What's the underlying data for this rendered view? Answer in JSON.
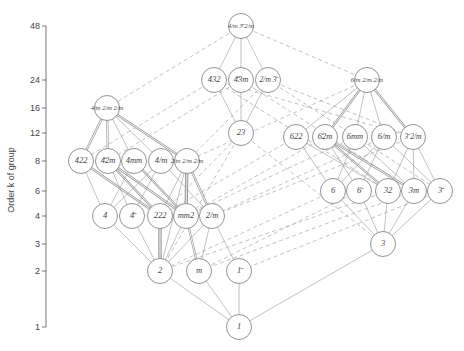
{
  "chart_data": {
    "type": "diagram",
    "title": "",
    "ylabel": "Order k of group",
    "y_ticks": [
      1,
      2,
      3,
      4,
      6,
      8,
      12,
      16,
      24,
      48
    ],
    "nodes": [
      {
        "id": "m3m",
        "label": "4/m 3̄ 2/m",
        "order": 48,
        "x": 241,
        "y": 26
      },
      {
        "id": "432",
        "label": "432",
        "order": 24,
        "x": 214,
        "y": 80
      },
      {
        "id": "-43m",
        "label": "4̄3m",
        "order": 24,
        "x": 241,
        "y": 80
      },
      {
        "id": "m-3",
        "label": "2/m 3̄",
        "order": 24,
        "x": 268,
        "y": 80
      },
      {
        "id": "6/mmm",
        "label": "6/m 2/m 2/m",
        "order": 24,
        "x": 367,
        "y": 80
      },
      {
        "id": "4/mmm",
        "label": "4/m 2/m 2/m",
        "order": 16,
        "x": 107,
        "y": 108
      },
      {
        "id": "23",
        "label": "23",
        "order": 12,
        "x": 241,
        "y": 133
      },
      {
        "id": "622",
        "label": "622",
        "order": 12,
        "x": 296,
        "y": 137
      },
      {
        "id": "-6m2",
        "label": "6̄2m",
        "order": 12,
        "x": 325,
        "y": 137
      },
      {
        "id": "6mm",
        "label": "6mm",
        "order": 12,
        "x": 355,
        "y": 137
      },
      {
        "id": "6/m",
        "label": "6/m",
        "order": 12,
        "x": 384,
        "y": 137
      },
      {
        "id": "-3m",
        "label": "3̄ 2/m",
        "order": 12,
        "x": 413,
        "y": 137
      },
      {
        "id": "422",
        "label": "422",
        "order": 8,
        "x": 81,
        "y": 161
      },
      {
        "id": "-42m",
        "label": "4̄2m",
        "order": 8,
        "x": 108,
        "y": 161
      },
      {
        "id": "4mm",
        "label": "4mm",
        "order": 8,
        "x": 134,
        "y": 161
      },
      {
        "id": "4/m",
        "label": "4/m",
        "order": 8,
        "x": 161,
        "y": 161
      },
      {
        "id": "mmm",
        "label": "2/m 2/m 2/m",
        "order": 8,
        "x": 187,
        "y": 161
      },
      {
        "id": "6",
        "label": "6",
        "order": 6,
        "x": 333,
        "y": 191
      },
      {
        "id": "-6",
        "label": "6̄",
        "order": 6,
        "x": 359,
        "y": 191
      },
      {
        "id": "32",
        "label": "32",
        "order": 6,
        "x": 388,
        "y": 191
      },
      {
        "id": "3m",
        "label": "3m",
        "order": 6,
        "x": 414,
        "y": 191
      },
      {
        "id": "-3",
        "label": "3̄",
        "order": 6,
        "x": 440,
        "y": 191
      },
      {
        "id": "4",
        "label": "4",
        "order": 4,
        "x": 105,
        "y": 216
      },
      {
        "id": "-4",
        "label": "4̄",
        "order": 4,
        "x": 132,
        "y": 216
      },
      {
        "id": "222",
        "label": "222",
        "order": 4,
        "x": 160,
        "y": 216
      },
      {
        "id": "mm2",
        "label": "mm2",
        "order": 4,
        "x": 186,
        "y": 216
      },
      {
        "id": "2/m",
        "label": "2/m",
        "order": 4,
        "x": 212,
        "y": 216
      },
      {
        "id": "3",
        "label": "3",
        "order": 3,
        "x": 383,
        "y": 244
      },
      {
        "id": "2",
        "label": "2",
        "order": 2,
        "x": 160,
        "y": 271
      },
      {
        "id": "m",
        "label": "m",
        "order": 2,
        "x": 199,
        "y": 271
      },
      {
        "id": "-1",
        "label": "1̄",
        "order": 2,
        "x": 239,
        "y": 271
      },
      {
        "id": "1",
        "label": "1",
        "order": 1,
        "x": 239,
        "y": 327
      }
    ]
  },
  "axis": {
    "label": "Order  k  of group",
    "ticks": [
      {
        "label": "48",
        "y": 26
      },
      {
        "label": "24",
        "y": 80
      },
      {
        "label": "16",
        "y": 108
      },
      {
        "label": "12",
        "y": 133
      },
      {
        "label": "8",
        "y": 161
      },
      {
        "label": "6",
        "y": 191
      },
      {
        "label": "4",
        "y": 216
      },
      {
        "label": "3",
        "y": 244
      },
      {
        "label": "2",
        "y": 271
      },
      {
        "label": "1",
        "y": 327
      }
    ]
  }
}
